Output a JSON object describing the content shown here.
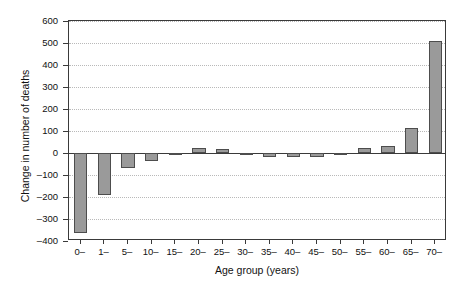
{
  "chart_data": {
    "type": "bar",
    "title": "",
    "xlabel": "Age group (years)",
    "ylabel": "Change in number of deaths",
    "categories": [
      "0–",
      "1–",
      "5–",
      "10–",
      "15–",
      "20–",
      "25–",
      "30–",
      "35–",
      "40–",
      "45–",
      "50–",
      "55–",
      "60–",
      "65–",
      "70–"
    ],
    "values": [
      -364,
      -192,
      -68,
      -37,
      -3,
      25,
      20,
      -3,
      -18,
      -17,
      -16,
      -4,
      25,
      33,
      113,
      510
    ],
    "ylim": [
      -400,
      600
    ],
    "yticks": [
      -400,
      -300,
      -200,
      -100,
      0,
      100,
      200,
      300,
      400,
      500,
      600
    ],
    "ytick_labels": [
      "–400",
      "–300",
      "–200",
      "–100",
      "0",
      "100",
      "200",
      "300",
      "400",
      "500",
      "600"
    ],
    "grid": true,
    "grid_axis": "y",
    "legend": "none",
    "bar_color": "#9a9a9a",
    "bar_edge_color": "#4d4d4d",
    "axis_color": "#3a3a3a",
    "grid_color": "#b9b9b9",
    "background": "#ffffff"
  }
}
